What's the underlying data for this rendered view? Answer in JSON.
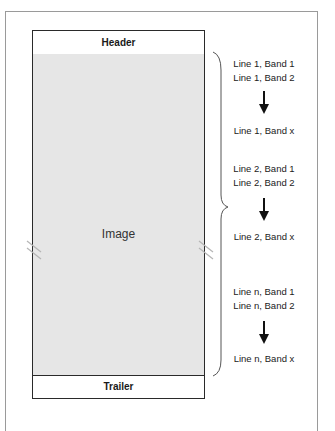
{
  "diagram": {
    "file_structure": {
      "header_label": "Header",
      "image_label": "Image",
      "trailer_label": "Trailer"
    },
    "line_groups": [
      {
        "band1": "Line 1, Band 1",
        "band2": "Line 1, Band 2",
        "arrow": "down-arrow",
        "bandx": "Line 1, Band x"
      },
      {
        "band1": "Line 2, Band 1",
        "band2": "Line 2, Band 2",
        "arrow": "down-arrow",
        "bandx": "Line 2, Band x"
      },
      {
        "band1": "Line n, Band 1",
        "band2": "Line n, Band 2",
        "arrow": "down-arrow",
        "bandx": "Line n, Band x"
      }
    ],
    "annotations": {
      "brace": "right-curly-brace spanning image region",
      "break_marks": "double-slash break marks on both sides of image"
    },
    "colors": {
      "image_fill": "#e6e6e6",
      "border": "#2a2a2a",
      "frame": "#9a9a9a"
    }
  }
}
